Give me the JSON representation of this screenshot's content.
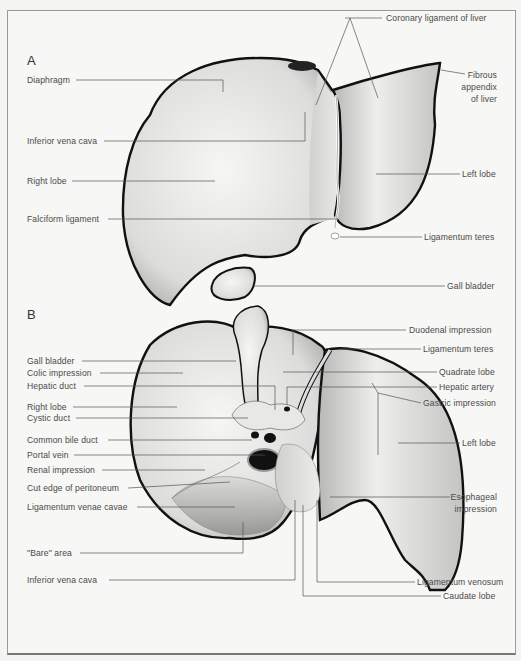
{
  "figure": {
    "panels": [
      {
        "id": "A",
        "label": "A",
        "view": "anterior",
        "left_labels": [
          "Diaphragm",
          "Inferior vena cava",
          "Right lobe",
          "Falciform ligament"
        ],
        "right_labels": [
          "Coronary ligament of liver",
          "Fibrous",
          "appendix",
          "of liver",
          "Left lobe",
          "Ligamentum teres",
          "Gall bladder"
        ]
      },
      {
        "id": "B",
        "label": "B",
        "view": "visceral",
        "left_labels": [
          "Gall bladder",
          "Colic impression",
          "Hepatic duct",
          "Right lobe",
          "Cystic duct",
          "Common bile duct",
          "Portal vein",
          "Renal impression",
          "Cut edge of peritoneum",
          "Ligamentum venae cavae",
          "\"Bare\" area",
          "Inferior vena cava"
        ],
        "right_labels": [
          "Duodenal impression",
          "Ligamentum teres",
          "Quadrate lobe",
          "Hepatic artery",
          "Gastric impression",
          "Left lobe",
          "Esophageal",
          "impression",
          "Ligamentum venosum",
          "Caudate lobe"
        ]
      }
    ],
    "colors": {
      "outline": "#111111",
      "leader": "#555555",
      "text": "#4a4a4a",
      "fill_light": "#f0f0ee",
      "fill_dark": "#a8a8a8"
    }
  }
}
